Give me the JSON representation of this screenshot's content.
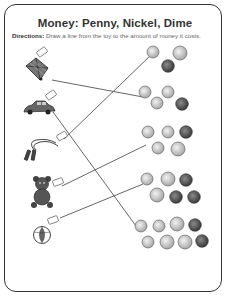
{
  "worksheet": {
    "title": "Money: Penny, Nickel, Dime",
    "directions_label": "Directions:",
    "directions_text": "Draw a line from the toy to the amount of money it costs."
  },
  "toys": [
    {
      "name": "kite",
      "icon": "kite-icon",
      "price_tag": "price tag"
    },
    {
      "name": "toy car",
      "icon": "car-icon",
      "price_tag": "price tag"
    },
    {
      "name": "jump rope",
      "icon": "jump-rope-icon",
      "price_tag": "price tag"
    },
    {
      "name": "teddy bear",
      "icon": "teddy-bear-icon",
      "price_tag": "price tag"
    },
    {
      "name": "beach ball",
      "icon": "ball-icon",
      "price_tag": "price tag"
    }
  ],
  "coin_groups": [
    {
      "coins": [
        "dime",
        "nickel",
        "penny"
      ]
    },
    {
      "coins": [
        "dime",
        "dime",
        "dime",
        "penny"
      ]
    },
    {
      "coins": [
        "dime",
        "dime",
        "penny",
        "dime",
        "nickel"
      ]
    },
    {
      "coins": [
        "dime",
        "nickel",
        "penny",
        "nickel",
        "penny",
        "penny"
      ]
    },
    {
      "coins": [
        "dime",
        "dime",
        "nickel",
        "penny",
        "dime",
        "nickel",
        "nickel",
        "penny"
      ]
    }
  ],
  "matches": [
    {
      "toy": "kite",
      "coin_group": 2
    },
    {
      "toy": "toy car",
      "coin_group": 5
    },
    {
      "toy": "jump rope",
      "coin_group": 1
    },
    {
      "toy": "teddy bear",
      "coin_group": 3
    },
    {
      "toy": "beach ball",
      "coin_group": 4
    }
  ],
  "colors": {
    "border": "#333333",
    "line": "#555555",
    "dime": "#c8c8c8",
    "nickel": "#bdbdbd",
    "penny": "#555555"
  }
}
